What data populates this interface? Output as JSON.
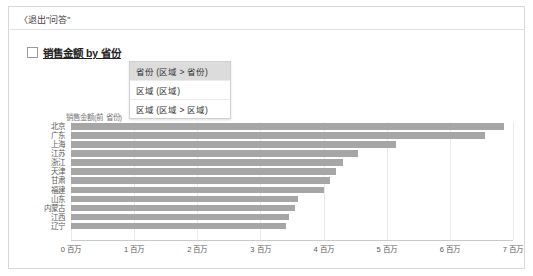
{
  "breadcrumb": "〈退出\"问答\"",
  "chart_title": "销售金额 by 省份",
  "menu": {
    "items": [
      {
        "label": "省份 (区域 > 省份)",
        "selected": true
      },
      {
        "label": "区域 (区域)",
        "selected": false
      },
      {
        "label": "区域 (区域 > 区域)",
        "selected": false
      }
    ]
  },
  "value_axis_title": "销售金额(前 省份)",
  "colors": {
    "bar": "#a6a6a6",
    "grid": "#e9e9e9",
    "axis": "#c9c9c9",
    "menu_selected": "#dcdcdc"
  },
  "chart_data": {
    "type": "bar",
    "orientation": "horizontal",
    "title": "销售金额 by 省份",
    "xlabel": "销售金额(前 省份)",
    "ylabel": "省份",
    "categories": [
      "北京",
      "广东",
      "上海",
      "江苏",
      "浙江",
      "天津",
      "甘肃",
      "福建",
      "山东",
      "内蒙古",
      "江西",
      "辽宁"
    ],
    "values": [
      6.85,
      6.55,
      5.15,
      4.55,
      4.3,
      4.2,
      4.1,
      4.0,
      3.6,
      3.55,
      3.45,
      3.4
    ],
    "xlim": [
      0,
      7
    ],
    "xticks": [
      0,
      1,
      2,
      3,
      4,
      5,
      6,
      7
    ],
    "xticklabels": [
      "0 百万",
      "1 百万",
      "2 百万",
      "3 百万",
      "4 百万",
      "5 百万",
      "6 百万",
      "7 百万"
    ],
    "grid": true,
    "legend": null
  }
}
